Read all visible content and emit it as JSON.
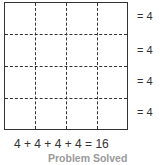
{
  "diagram": {
    "grid": {
      "rows": 4,
      "cols": 4
    },
    "row_labels": [
      "= 4",
      "= 4",
      "= 4",
      "= 4"
    ],
    "equation": "4 + 4 + 4 + 4 = 16",
    "caption": "Problem Solved"
  }
}
